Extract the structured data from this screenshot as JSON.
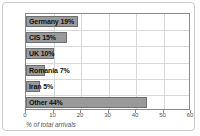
{
  "chart_data": {
    "type": "bar",
    "orientation": "horizontal",
    "title": "",
    "subtitle": "",
    "xlabel": "% of total arrivals",
    "ylabel": "",
    "xlim": [
      0,
      60
    ],
    "xticks": [
      0,
      10,
      20,
      30,
      40,
      50,
      60
    ],
    "xtick_labels": [
      "0",
      "10",
      "20",
      "30",
      "40",
      "50",
      "60"
    ],
    "grid": true,
    "legend": "none",
    "categories": [
      "Germany",
      "CIS",
      "UK",
      "Romania",
      "Iran",
      "Other"
    ],
    "values": [
      19,
      15,
      10,
      7,
      5,
      44
    ],
    "bar_labels": [
      "Germany 19%",
      "CIS 15%",
      "UK 10%",
      "Romania 7%",
      "Iran 5%",
      "Other 44%"
    ],
    "colors": {
      "bar_fill": "#9a9a9a",
      "bar_border": "#6f6f6f",
      "grid": "#d8d8d8",
      "axis": "#8a8a8a",
      "label_text": "#111111",
      "tick_text": "#555555",
      "frame_border": "#c9c9c9",
      "background": "#ffffff"
    }
  }
}
